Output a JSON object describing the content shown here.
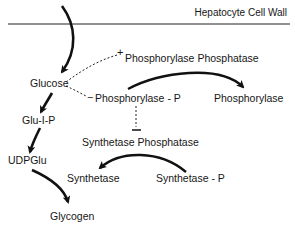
{
  "title": "Hepatocyte Cell Wall",
  "nodes": {
    "glucose": "Glucose",
    "glu1p": "Glu-I-P",
    "udpglu": "UDPGlu",
    "glycogen": "Glycogen",
    "phosphorylase_phosphatase": "Phosphorylase  Phosphatase",
    "phosphorylase_p": "Phosphorylase - P",
    "phosphorylase": "Phosphorylase",
    "synthetase_phosphatase": "Synthetase  Phosphatase",
    "synthetase": "Synthetase",
    "synthetase_p": "Synthetase - P"
  },
  "signs": {
    "activate": "+",
    "inhibit": "−"
  },
  "edges": [
    {
      "from": "outside",
      "to": "glucose",
      "type": "conversion",
      "style": "solid-thick"
    },
    {
      "from": "glucose",
      "to": "glu1p",
      "type": "conversion",
      "style": "solid-thick"
    },
    {
      "from": "glu1p",
      "to": "udpglu",
      "type": "conversion",
      "style": "solid-thick"
    },
    {
      "from": "udpglu",
      "to": "glycogen",
      "type": "conversion",
      "style": "solid-thick"
    },
    {
      "from": "phosphorylase_p",
      "to": "phosphorylase",
      "type": "conversion",
      "style": "solid-thick"
    },
    {
      "from": "synthetase_p",
      "to": "synthetase",
      "type": "conversion",
      "style": "solid-thick"
    },
    {
      "from": "glucose",
      "to": "phosphorylase_phosphatase",
      "type": "activation",
      "sign": "+",
      "style": "dashed"
    },
    {
      "from": "glucose",
      "to": "phosphorylase_p",
      "type": "inhibition",
      "sign": "-",
      "style": "dashed"
    },
    {
      "from": "phosphorylase_p",
      "to": "synthetase_phosphatase",
      "type": "inhibition",
      "sign": "-",
      "style": "dashed"
    }
  ]
}
